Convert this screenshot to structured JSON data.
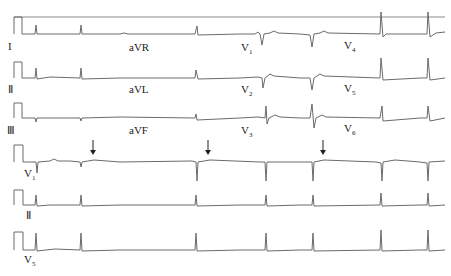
{
  "ecg": {
    "top_rows": [
      {
        "y": 48,
        "labels": [
          {
            "text": "I",
            "x": 8
          },
          {
            "text": "aVR",
            "x": 129
          },
          {
            "text": "V1",
            "x": 241
          },
          {
            "text": "V4",
            "x": 344
          }
        ]
      },
      {
        "y": 90,
        "labels": [
          {
            "text": "II",
            "x": 8
          },
          {
            "text": "aVL",
            "x": 129
          },
          {
            "text": "V2",
            "x": 241
          },
          {
            "text": "V5",
            "x": 344
          }
        ]
      },
      {
        "y": 132,
        "labels": [
          {
            "text": "III",
            "x": 8
          },
          {
            "text": "aVF",
            "x": 129
          },
          {
            "text": "V3",
            "x": 241
          },
          {
            "text": "V6",
            "x": 344
          }
        ]
      }
    ],
    "rhythm_rows": [
      {
        "label": "V1",
        "y": 181
      },
      {
        "label": "II",
        "y": 221
      },
      {
        "label": "V5",
        "y": 265
      }
    ],
    "labels": {
      "I": "I",
      "II": "Ⅱ",
      "III": "Ⅲ",
      "aVR": "aVR",
      "aVL": "aVL",
      "aVF": "aVF",
      "V1": "V",
      "V2": "V",
      "V3": "V",
      "V4": "V",
      "V5": "V",
      "V6": "V",
      "V1sub": "1",
      "V2sub": "2",
      "V3sub": "3",
      "V4sub": "4",
      "V5sub": "5",
      "V6sub": "6",
      "rV1": "V",
      "rV1sub": "1",
      "rII": "Ⅱ",
      "rV5": "V",
      "rV5sub": "5"
    },
    "arrows": [
      {
        "x": 93,
        "label": "arrow-1"
      },
      {
        "x": 208,
        "label": "arrow-2"
      },
      {
        "x": 323,
        "label": "arrow-3"
      }
    ],
    "qrs_x": [
      36,
      82,
      198,
      267,
      382,
      428
    ],
    "trace_color": "#6a6a6a"
  }
}
